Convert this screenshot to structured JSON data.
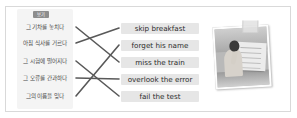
{
  "exercise": {
    "badge_label": "보기",
    "korean_items": [
      {
        "id": "kr1",
        "text": "그 기차를 놓치다"
      },
      {
        "id": "kr2",
        "text": "아침 식사를 거르다"
      },
      {
        "id": "kr3",
        "text": "그 시험에 떨어지다"
      },
      {
        "id": "kr4",
        "text": "그 오류를 간과하다"
      },
      {
        "id": "kr5",
        "text": "그의 이름을 잊다"
      }
    ],
    "english_items": [
      {
        "id": "en1",
        "text": "skip breakfast"
      },
      {
        "id": "en2",
        "text": "forget his name"
      },
      {
        "id": "en3",
        "text": "miss the train"
      },
      {
        "id": "en4",
        "text": "overlook the error"
      },
      {
        "id": "en5",
        "text": "fail the test"
      }
    ],
    "matches": [
      {
        "from": "kr1",
        "to": "en3"
      },
      {
        "from": "kr2",
        "to": "en1"
      },
      {
        "from": "kr3",
        "to": "en5"
      },
      {
        "from": "kr4",
        "to": "en4"
      },
      {
        "from": "kr5",
        "to": "en2"
      }
    ],
    "photo_alt": "student-studying-photo"
  },
  "colors": {
    "frame_border": "#d9d9d9",
    "panel_bg": "#f4f4f4",
    "chip_bg": "#e6e6e6",
    "badge_bg": "#8d8d8d",
    "line": "#595959",
    "text": "#2c2c2c"
  }
}
